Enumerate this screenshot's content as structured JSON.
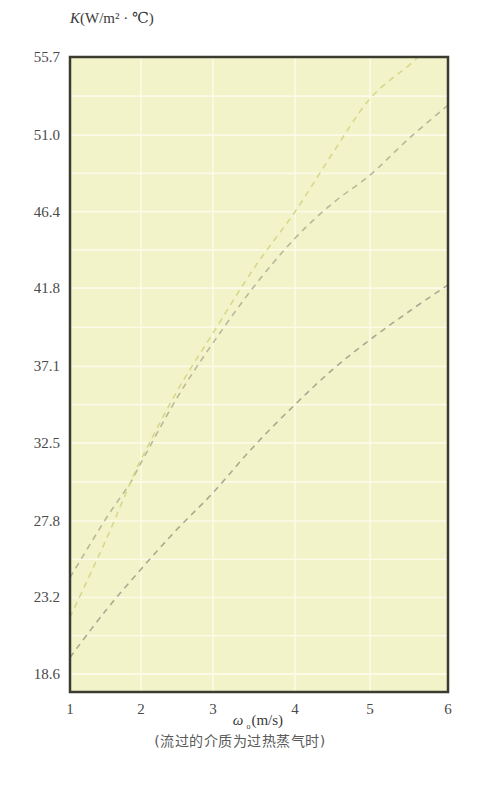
{
  "chart_data": {
    "type": "line",
    "title": "",
    "ylabel": "K(W/m² · ℃)",
    "ylabel_parts": {
      "var": "K",
      "unit": "(W/m² · ℃)"
    },
    "xlabel": "ω ₀(m/s)",
    "xlabel_parts": {
      "var": "ω",
      "sub": "o",
      "unit": "(m/s)"
    },
    "caption": "(流过的介质为过热蒸气时)",
    "xlim": [
      1,
      6
    ],
    "ylim": [
      17.5,
      55.7
    ],
    "x_ticks": [
      1,
      2,
      3,
      4,
      5,
      6
    ],
    "x_tick_labels": [
      "1",
      "2",
      "3",
      "4",
      "5",
      "6"
    ],
    "y_ticks": [
      55.7,
      51.0,
      46.4,
      41.8,
      37.1,
      32.5,
      27.8,
      23.2,
      18.6
    ],
    "y_tick_labels": [
      "55.7",
      "51.0",
      "46.4",
      "41.8",
      "37.1",
      "32.5",
      "27.8",
      "23.2",
      "18.6"
    ],
    "grid": true,
    "legend": "none",
    "colors": {
      "plot_background": "#f2f3c9",
      "gridline": "#fbfbe8",
      "frame": "#3b3b30"
    },
    "series": [
      {
        "name": "curve-upper-gray",
        "color": "#b8b89a",
        "style": "dashed",
        "x": [
          1.0,
          1.5,
          1.85,
          2.0,
          2.5,
          3.0,
          3.5,
          4.0,
          4.5,
          5.0,
          5.5,
          6.0
        ],
        "y": [
          24.4,
          27.9,
          30.1,
          31.3,
          35.2,
          38.5,
          41.9,
          44.8,
          46.9,
          48.6,
          50.8,
          52.8
        ]
      },
      {
        "name": "curve-yellow",
        "color": "#d6d98c",
        "style": "dashed",
        "x": [
          1.0,
          1.5,
          1.85,
          2.0,
          2.5,
          3.0,
          3.5,
          4.0,
          4.5,
          5.0,
          5.5,
          5.62
        ],
        "y": [
          22.0,
          26.6,
          30.1,
          31.5,
          35.6,
          39.1,
          43.0,
          46.4,
          49.9,
          53.2,
          55.2,
          55.7
        ]
      },
      {
        "name": "curve-lower-gray",
        "color": "#a9a990",
        "style": "dashed",
        "x": [
          1.0,
          1.5,
          2.0,
          2.5,
          3.0,
          3.5,
          4.0,
          4.5,
          5.0,
          5.5,
          6.0
        ],
        "y": [
          19.6,
          22.4,
          24.9,
          27.3,
          29.5,
          32.3,
          34.8,
          36.9,
          38.7,
          40.4,
          42.0
        ]
      }
    ]
  }
}
